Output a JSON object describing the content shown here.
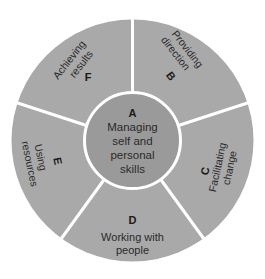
{
  "colors": {
    "background": "#ffffff",
    "outer_ring": "#a9a9a9",
    "inner_circle": "#9a9a9a",
    "divider": "#ffffff",
    "text": "#2a2a2a"
  },
  "center": {
    "letter": "A",
    "lines": [
      "Managing",
      "self and",
      "personal",
      "skills"
    ]
  },
  "segments": [
    {
      "id": "B",
      "letter": "B",
      "lines": [
        "Providing",
        "direction"
      ]
    },
    {
      "id": "C",
      "letter": "C",
      "lines": [
        "Facilitating",
        "change"
      ]
    },
    {
      "id": "D",
      "letter": "D",
      "lines": [
        "Working with",
        "people"
      ]
    },
    {
      "id": "E",
      "letter": "E",
      "lines": [
        "Using",
        "resources"
      ]
    },
    {
      "id": "F",
      "letter": "F",
      "lines": [
        "Achieving",
        "results"
      ]
    }
  ]
}
